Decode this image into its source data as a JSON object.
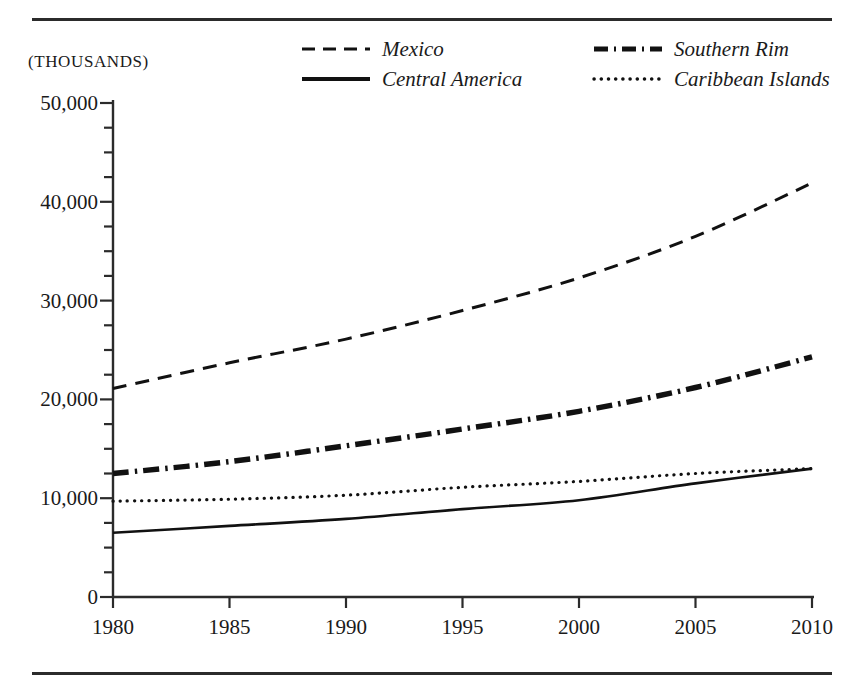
{
  "figure": {
    "units_caption": "(THOUSANDS)"
  },
  "legend": {
    "position": "top",
    "entries": [
      {
        "label": "Mexico",
        "style": "dashed",
        "icon": "dashed-line-swatch"
      },
      {
        "label": "Southern Rim",
        "style": "dash-dot",
        "icon": "dash-dot-line-swatch"
      },
      {
        "label": "Central America",
        "style": "solid",
        "icon": "solid-line-swatch"
      },
      {
        "label": "Caribbean Islands",
        "style": "dotted",
        "icon": "dotted-line-swatch"
      }
    ]
  },
  "axes": {
    "y_ticks": [
      "50,000",
      "40,000",
      "30,000",
      "20,000",
      "10,000",
      "0"
    ],
    "y_tick_values": [
      50000,
      40000,
      30000,
      20000,
      10000,
      0
    ],
    "y_minor_step": 2500,
    "x_ticks": [
      "1980",
      "1985",
      "1990",
      "1995",
      "2000",
      "2005",
      "2010"
    ],
    "x_tick_values": [
      1980,
      1985,
      1990,
      1995,
      2000,
      2005,
      2010
    ]
  },
  "chart_data": {
    "type": "line",
    "title": "",
    "xlabel": "",
    "ylabel": "(THOUSANDS)",
    "xlim": [
      1980,
      2010
    ],
    "ylim": [
      0,
      50000
    ],
    "grid": false,
    "legend_position": "top",
    "x": [
      1980,
      1985,
      1990,
      1995,
      2000,
      2005,
      2010
    ],
    "series": [
      {
        "name": "Mexico",
        "style": "dashed",
        "values": [
          21100,
          23700,
          26100,
          29000,
          32300,
          36500,
          41900
        ]
      },
      {
        "name": "Southern Rim",
        "style": "dash-dot",
        "values": [
          12500,
          13700,
          15300,
          17000,
          18800,
          21200,
          24300
        ]
      },
      {
        "name": "Central America",
        "style": "solid",
        "values": [
          6500,
          7200,
          7900,
          8900,
          9800,
          11500,
          13000
        ]
      },
      {
        "name": "Caribbean Islands",
        "style": "dotted",
        "values": [
          9700,
          9900,
          10300,
          11100,
          11700,
          12500,
          13000
        ]
      }
    ]
  }
}
